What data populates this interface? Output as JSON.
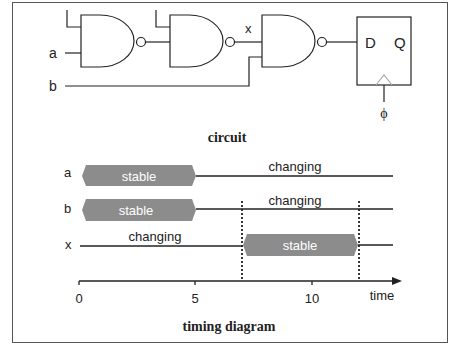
{
  "circuit": {
    "caption": "circuit",
    "inputs": [
      {
        "label": "a"
      },
      {
        "label": "b"
      }
    ],
    "internal_signal": {
      "label": "x"
    },
    "gates": [
      {
        "type": "NAND",
        "name": "gate-1"
      },
      {
        "type": "NAND",
        "name": "gate-2"
      },
      {
        "type": "NAND",
        "name": "gate-3"
      }
    ],
    "flip_flop": {
      "d_label": "D",
      "q_label": "Q",
      "clock_label": "ϕ"
    }
  },
  "timing": {
    "caption": "timing diagram",
    "axis": {
      "label": "time",
      "ticks": [
        "0",
        "5",
        "10"
      ]
    },
    "rows": [
      {
        "signal": "a",
        "stable_label": "stable",
        "changing_label": "changing",
        "stable_from": 0,
        "stable_to": 5
      },
      {
        "signal": "b",
        "stable_label": "stable",
        "changing_label": "changing",
        "stable_from": 0,
        "stable_to": 5
      },
      {
        "signal": "x",
        "stable_label": "stable",
        "changing_label": "changing",
        "stable_from": 7,
        "stable_to": 12
      }
    ],
    "markers": [
      7,
      12
    ]
  },
  "colors": {
    "line": "#222222",
    "stable_fill": "#8c8c8c",
    "stable_text": "#ffffff",
    "frame": "#555555"
  }
}
